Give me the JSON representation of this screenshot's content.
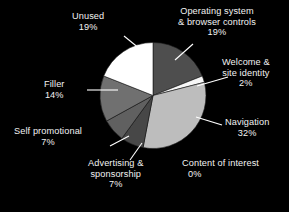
{
  "chart_data": {
    "type": "pie",
    "title": "",
    "subtitle": "",
    "xlabel": "",
    "ylabel": "",
    "legend_position": "none",
    "grid": false,
    "background_color": "#000000",
    "text_color": "#f2f2f2",
    "units": "percent",
    "categories": [
      "Operating system & browser controls",
      "Welcome & site identity",
      "Navigation",
      "Content of interest",
      "Advertising & sponsorship",
      "Self promotional",
      "Filler",
      "Unused"
    ],
    "values": [
      19,
      2,
      32,
      0,
      7,
      7,
      14,
      19
    ],
    "slices": [
      {
        "label": "Operating system & browser controls",
        "value": 19,
        "value_text": "19%",
        "color": "#4e4e4e",
        "label_lines": [
          "Operating system",
          "& browser controls"
        ],
        "has_leader": true
      },
      {
        "label": "Welcome & site identity",
        "value": 2,
        "value_text": "2%",
        "color": "#f7f7f7",
        "label_lines": [
          "Welcome &",
          "site identity"
        ],
        "has_leader": true
      },
      {
        "label": "Navigation",
        "value": 32,
        "value_text": "32%",
        "color": "#bdbdbd",
        "label_lines": [
          "Navigation"
        ],
        "has_leader": true
      },
      {
        "label": "Content of interest",
        "value": 0,
        "value_text": "0%",
        "color": "#8a8a8a",
        "label_lines": [
          "Content of interest"
        ],
        "has_leader": false
      },
      {
        "label": "Advertising & sponsorship",
        "value": 7,
        "value_text": "7%",
        "color": "#474747",
        "label_lines": [
          "Advertising &",
          "sponsorship"
        ],
        "has_leader": true
      },
      {
        "label": "Self promotional",
        "value": 7,
        "value_text": "7%",
        "color": "#606060",
        "label_lines": [
          "Self promotional"
        ],
        "has_leader": true
      },
      {
        "label": "Filler",
        "value": 14,
        "value_text": "14%",
        "color": "#707070",
        "label_lines": [
          "Filler"
        ],
        "has_leader": true
      },
      {
        "label": "Unused",
        "value": 19,
        "value_text": "19%",
        "color": "#ffffff",
        "label_lines": [
          "Unused"
        ],
        "has_leader": true
      }
    ]
  },
  "labels": {
    "os": {
      "line1": "Operating system",
      "line2": "& browser controls",
      "pct": "19%"
    },
    "welcome": {
      "line1": "Welcome &",
      "line2": "site identity",
      "pct": "2%"
    },
    "navigation": {
      "line1": "Navigation",
      "pct": "32%"
    },
    "content": {
      "line1": "Content of interest",
      "pct": "0%"
    },
    "advertising": {
      "line1": "Advertising &",
      "line2": "sponsorship",
      "pct": "7%"
    },
    "selfpromo": {
      "line1": "Self promotional",
      "pct": "7%"
    },
    "filler": {
      "line1": "Filler",
      "pct": "14%"
    },
    "unused": {
      "line1": "Unused",
      "pct": "19%"
    }
  }
}
